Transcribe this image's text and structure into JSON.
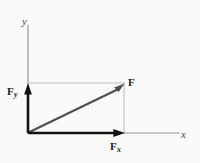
{
  "figure": {
    "background_color": "#fbfbfa",
    "width": 200,
    "height": 163
  },
  "axes": {
    "x_label": "x",
    "y_label": "y",
    "color": "#9a9a9a",
    "origin": {
      "x": 28,
      "y": 133
    },
    "x_axis_end": {
      "x": 180,
      "y": 133
    },
    "y_axis_top": {
      "x": 28,
      "y": 25
    }
  },
  "vectors": [
    {
      "id": "resultant",
      "label": "F",
      "subscript": "",
      "color": "#4f4f55",
      "from": {
        "x": 28,
        "y": 133
      },
      "to": {
        "x": 124,
        "y": 84
      },
      "label_pos": {
        "x": 128,
        "y": 77
      }
    },
    {
      "id": "y-component",
      "label": "F",
      "subscript": "y",
      "color": "#121212",
      "from": {
        "x": 28,
        "y": 133
      },
      "to": {
        "x": 28,
        "y": 84
      },
      "label_pos": {
        "x": 7,
        "y": 86
      }
    },
    {
      "id": "x-component",
      "label": "F",
      "subscript": "x",
      "color": "#121212",
      "from": {
        "x": 28,
        "y": 133
      },
      "to": {
        "x": 124,
        "y": 133
      },
      "label_pos": {
        "x": 110,
        "y": 141
      }
    }
  ],
  "construction_lines": {
    "color": "#bdbdbd",
    "horizontal": {
      "x1": 28,
      "y1": 83,
      "x2": 124,
      "y2": 83
    },
    "vertical": {
      "x1": 124,
      "y1": 83,
      "x2": 124,
      "y2": 133
    }
  }
}
